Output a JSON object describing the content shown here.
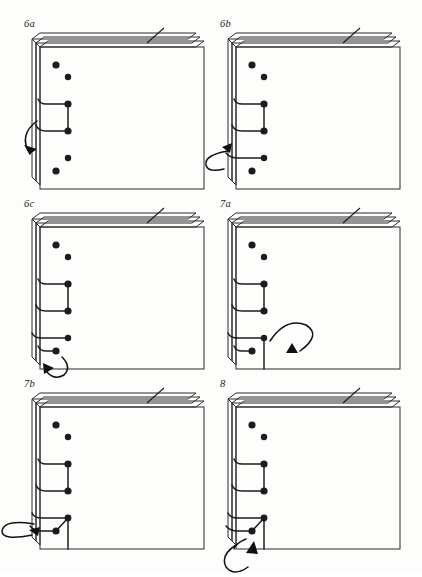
{
  "figure": {
    "type": "instructional-diagram",
    "background_color": "#fdfdfc",
    "ink_color": "#1c1c1c",
    "page_fill_color": "#ffffff",
    "panel_count": 6,
    "columns": 2,
    "rows": 3
  },
  "panels": [
    {
      "id": "panel-6a",
      "label": "6a",
      "row": 1,
      "column": 1,
      "description": "Stack of sheets seen from the front with five spine holes; thread loops around the spine at the two middle holes and a curved arrow sweeps from the left into the spine.",
      "holes": [
        {
          "index": 1,
          "cx": 30,
          "cy": 28,
          "r": 3.4
        },
        {
          "index": 2,
          "cx": 38,
          "cy": 40,
          "r": 3.0
        },
        {
          "index": 3,
          "cx": 38,
          "cy": 68,
          "r": 3.4
        },
        {
          "index": 4,
          "cx": 38,
          "cy": 95,
          "r": 3.4
        },
        {
          "index": 5,
          "cx": 38,
          "cy": 122,
          "r": 3.0
        },
        {
          "index": 6,
          "cx": 30,
          "cy": 134,
          "r": 3.4
        }
      ],
      "thread_segments": 2,
      "arrow": {
        "kind": "curved-sweep",
        "from": "left-outside",
        "to": "spine",
        "direction": "down-right"
      },
      "tick_marker": true
    },
    {
      "id": "panel-6b",
      "label": "6b",
      "row": 1,
      "column": 2,
      "description": "Same stack; thread now wraps three holes and a flat loop arrow comes around the spine from the lower left.",
      "holes": [
        {
          "index": 1,
          "cx": 30,
          "cy": 28,
          "r": 3.4
        },
        {
          "index": 2,
          "cx": 38,
          "cy": 40,
          "r": 3.0
        },
        {
          "index": 3,
          "cx": 38,
          "cy": 68,
          "r": 3.4
        },
        {
          "index": 4,
          "cx": 38,
          "cy": 95,
          "r": 3.4
        },
        {
          "index": 5,
          "cx": 38,
          "cy": 122,
          "r": 3.0
        },
        {
          "index": 6,
          "cx": 30,
          "cy": 134,
          "r": 3.4
        }
      ],
      "thread_segments": 3,
      "arrow": {
        "kind": "flat-loop",
        "from": "left-outside",
        "to": "spine",
        "direction": "right"
      },
      "tick_marker": true
    },
    {
      "id": "panel-6c",
      "label": "6c",
      "row": 2,
      "column": 1,
      "description": "Thread now wraps four holes; a looping arrow curls up from beneath the lower-left corner of the stack.",
      "holes": [
        {
          "index": 1,
          "cx": 30,
          "cy": 28,
          "r": 3.4
        },
        {
          "index": 2,
          "cx": 38,
          "cy": 40,
          "r": 3.0
        },
        {
          "index": 3,
          "cx": 38,
          "cy": 68,
          "r": 3.4
        },
        {
          "index": 4,
          "cx": 38,
          "cy": 95,
          "r": 3.4
        },
        {
          "index": 5,
          "cx": 38,
          "cy": 122,
          "r": 3.0
        },
        {
          "index": 6,
          "cx": 30,
          "cy": 134,
          "r": 3.4
        }
      ],
      "thread_segments": 4,
      "arrow": {
        "kind": "bottom-loop",
        "from": "below",
        "to": "corner-hole",
        "direction": "up-right"
      },
      "tick_marker": true
    },
    {
      "id": "panel-7a",
      "label": "7a",
      "row": 2,
      "column": 2,
      "description": "Thread wraps the spine holes and turns the corner; a large loop arrow curls over the bottom-left corner of the text block pointing back inwards.",
      "holes": [
        {
          "index": 1,
          "cx": 30,
          "cy": 28,
          "r": 3.4
        },
        {
          "index": 2,
          "cx": 38,
          "cy": 40,
          "r": 3.0
        },
        {
          "index": 3,
          "cx": 38,
          "cy": 68,
          "r": 3.4
        },
        {
          "index": 4,
          "cx": 38,
          "cy": 95,
          "r": 3.4
        },
        {
          "index": 5,
          "cx": 38,
          "cy": 122,
          "r": 3.0
        },
        {
          "index": 6,
          "cx": 30,
          "cy": 134,
          "r": 3.4
        }
      ],
      "thread_segments": 4,
      "arrow": {
        "kind": "corner-loop",
        "from": "corner",
        "to": "inward",
        "direction": "down-left"
      },
      "tick_marker": true
    },
    {
      "id": "panel-7b",
      "label": "7b",
      "row": 3,
      "column": 1,
      "description": "Corner wrap complete; a flat loop arrow returns from the left into the corner hole where a short diagonal stitch has been made.",
      "holes": [
        {
          "index": 1,
          "cx": 30,
          "cy": 28,
          "r": 3.4
        },
        {
          "index": 2,
          "cx": 38,
          "cy": 40,
          "r": 3.0
        },
        {
          "index": 3,
          "cx": 38,
          "cy": 68,
          "r": 3.4
        },
        {
          "index": 4,
          "cx": 38,
          "cy": 95,
          "r": 3.4
        },
        {
          "index": 5,
          "cx": 38,
          "cy": 122,
          "r": 3.0
        },
        {
          "index": 6,
          "cx": 30,
          "cy": 134,
          "r": 3.4
        }
      ],
      "thread_segments": 4,
      "arrow": {
        "kind": "flat-loop",
        "from": "left-outside",
        "to": "corner-hole",
        "direction": "right"
      },
      "tick_marker": true
    },
    {
      "id": "panel-8",
      "label": "8",
      "row": 3,
      "column": 2,
      "description": "Final step; the thread is carried under the bottom edge and a loop arrow rises from below into the corner hole.",
      "holes": [
        {
          "index": 1,
          "cx": 30,
          "cy": 28,
          "r": 3.4
        },
        {
          "index": 2,
          "cx": 38,
          "cy": 40,
          "r": 3.0
        },
        {
          "index": 3,
          "cx": 38,
          "cy": 68,
          "r": 3.4
        },
        {
          "index": 4,
          "cx": 38,
          "cy": 95,
          "r": 3.4
        },
        {
          "index": 5,
          "cx": 38,
          "cy": 122,
          "r": 3.0
        },
        {
          "index": 6,
          "cx": 30,
          "cy": 134,
          "r": 3.4
        }
      ],
      "thread_segments": 5,
      "arrow": {
        "kind": "bottom-loop",
        "from": "below",
        "to": "corner-hole",
        "direction": "up-right"
      },
      "tick_marker": true
    }
  ]
}
